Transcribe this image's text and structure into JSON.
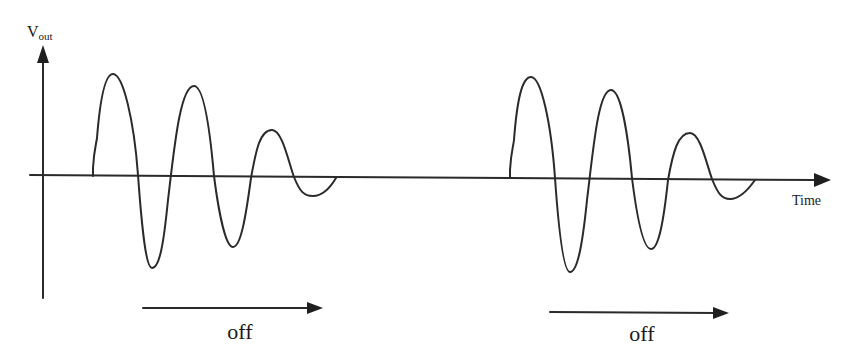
{
  "diagram": {
    "type": "waveform-sketch",
    "y_axis": {
      "label_main": "V",
      "label_sub": "out"
    },
    "x_axis": {
      "label": "Time"
    },
    "bursts": [
      {
        "name": "burst-1",
        "relative_extrema": [
          1.0,
          -0.88,
          0.88,
          -0.67,
          0.45,
          -0.19
        ],
        "off_label": "off"
      },
      {
        "name": "burst-2",
        "relative_extrema": [
          0.98,
          -0.93,
          0.86,
          -0.71,
          0.43,
          -0.22
        ],
        "off_label": "off"
      }
    ],
    "colors": {
      "ink": "#2a2a2a",
      "background": "#ffffff"
    }
  }
}
